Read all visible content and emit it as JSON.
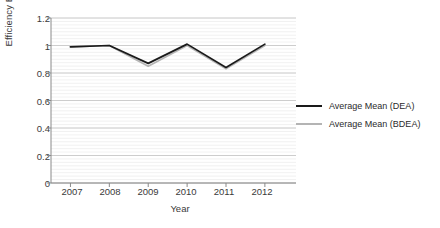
{
  "chart_data": {
    "type": "line",
    "title": "",
    "xlabel": "Year",
    "ylabel": "Efficiency Estimates",
    "categories": [
      "2007",
      "2008",
      "2009",
      "2010",
      "2011",
      "2012"
    ],
    "x": [
      2007,
      2008,
      2009,
      2010,
      2011,
      2012
    ],
    "series": [
      {
        "name": "Average Mean (DEA)",
        "color": "#1a1a1a",
        "values": [
          0.99,
          1.0,
          0.87,
          1.01,
          0.84,
          1.01
        ]
      },
      {
        "name": "Average Mean (BDEA)",
        "color": "#b4b4b4",
        "values": [
          0.99,
          1.0,
          0.85,
          1.0,
          0.83,
          1.0
        ]
      }
    ],
    "ylim": [
      0,
      1.2
    ],
    "yticks": [
      0,
      0.2,
      0.4,
      0.6,
      0.8,
      1,
      1.2
    ],
    "ytick_labels": [
      "0",
      "0.2",
      "0.4",
      "0.6",
      "0.8",
      "1",
      "1.2"
    ],
    "xlim": [
      2006.5,
      2012.8
    ],
    "grid": "horizontal-minor-and-major",
    "legend_position": "right",
    "legend": [
      "Average Mean (DEA)",
      "Average Mean (BDEA)"
    ],
    "background": "#ffffff",
    "gridline_color_major": "#c8c8c8",
    "gridline_color_minor": "#ededed",
    "axis_color": "#8a8a8a"
  }
}
